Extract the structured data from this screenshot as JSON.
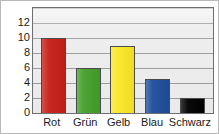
{
  "chart_data": {
    "type": "bar",
    "title": "",
    "subtitle": "",
    "xlabel": "",
    "ylabel": "",
    "categories": [
      "Rot",
      "Grün",
      "Gelb",
      "Blau",
      "Schwarz"
    ],
    "values": [
      10,
      6,
      9,
      4.5,
      2
    ],
    "bar_colors": [
      "#c62016",
      "#43a02a",
      "#fae827",
      "#1f4e9c",
      "#000000"
    ],
    "ylim": [
      0,
      14
    ],
    "ytick_labels": [
      "0",
      "2",
      "4",
      "6",
      "8",
      "10",
      "12"
    ],
    "ytick_values": [
      0,
      2,
      4,
      6,
      8,
      10,
      12
    ],
    "gridlines": true,
    "gridline_values": [
      2,
      4,
      6,
      8,
      10,
      12,
      14
    ],
    "legend": false,
    "legend_position": "none",
    "annotations": [],
    "plot_background": "#ededed",
    "grid_color": "#8d8f90",
    "axis_color": "#6d6f70",
    "bar_outline_color": "#4a4a4a",
    "text_color": "#1a1a1a"
  }
}
